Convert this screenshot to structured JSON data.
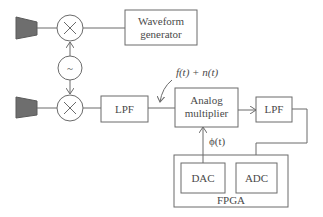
{
  "diagram": {
    "blocks": {
      "waveform_generator": {
        "line1": "Waveform",
        "line2": "generator"
      },
      "lpf1": "LPF",
      "analog_multiplier": {
        "line1": "Analog",
        "line2": "multiplier"
      },
      "lpf2": "LPF",
      "dac": "DAC",
      "adc": "ADC",
      "fpga": "FPGA"
    },
    "symbols": {
      "mixer": "×",
      "oscillator": "~"
    },
    "signals": {
      "input": "f(t) + n(t)",
      "reference": "ϕ(t)"
    },
    "colors": {
      "line": "#6b6b6b",
      "horn_fill": "#6e6e6e",
      "text": "#4a4a4a"
    }
  }
}
